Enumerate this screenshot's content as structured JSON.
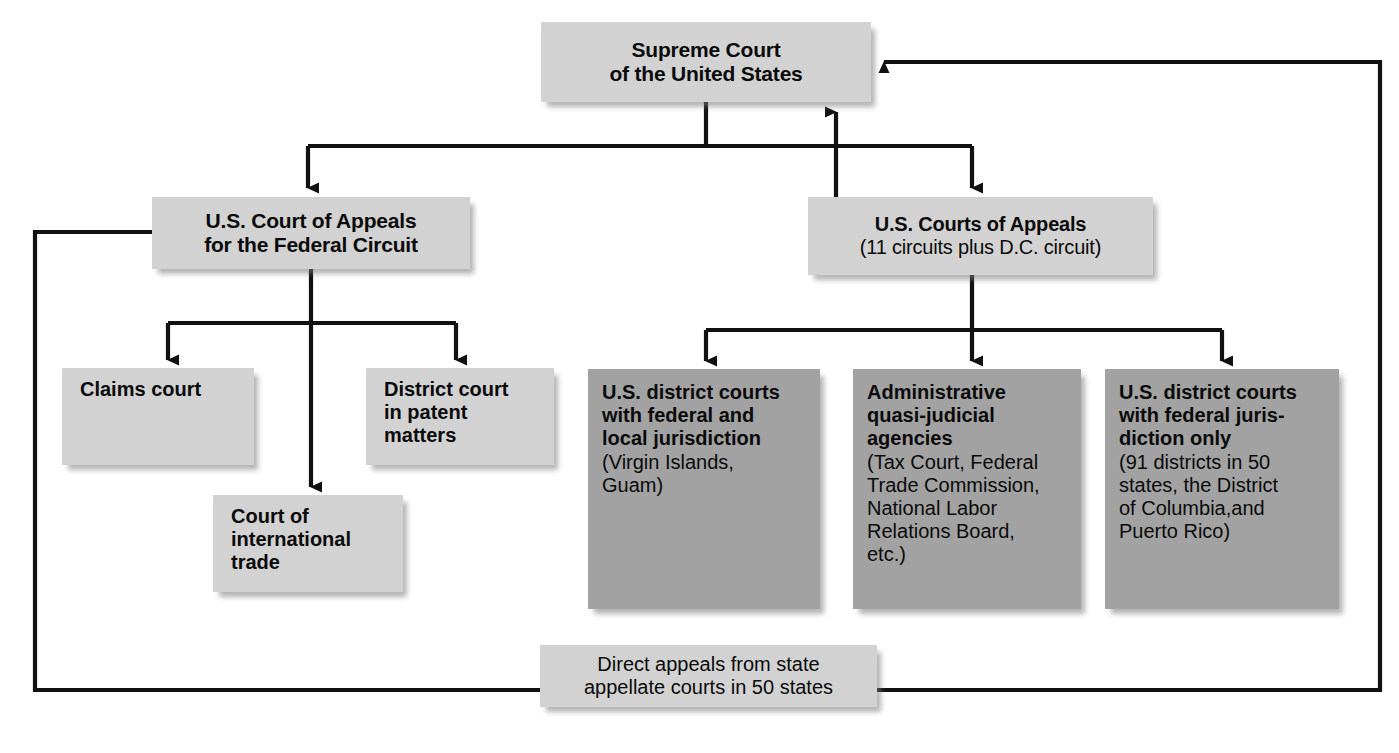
{
  "colors": {
    "box_light": "#d2d2d2",
    "box_dark": "#a2a2a2",
    "line": "#111111",
    "background": "#ffffff"
  },
  "nodes": {
    "supreme": {
      "label": "Supreme Court\nof the United States",
      "level": "top",
      "shade": "light"
    },
    "federal_circuit": {
      "label": "U.S. Court of Appeals\nfor the Federal Circuit",
      "level": "appellate",
      "shade": "light"
    },
    "courts_appeals": {
      "label": "U.S. Courts of Appeals",
      "sublabel": "(11 circuits plus D.C. circuit)",
      "level": "appellate",
      "shade": "light"
    },
    "claims_court": {
      "label": "Claims court",
      "level": "trial",
      "shade": "light"
    },
    "district_patent": {
      "label": "District court\nin patent\nmatters",
      "level": "trial",
      "shade": "light"
    },
    "international_trade": {
      "label": "Court of\ninternational\ntrade",
      "level": "trial",
      "shade": "light"
    },
    "district_local": {
      "label": "U.S. district courts\nwith federal and\nlocal jurisdiction",
      "sublabel": "(Virgin Islands,\nGuam)",
      "level": "trial",
      "shade": "dark"
    },
    "admin_agencies": {
      "label": "Administrative\nquasi-judicial\nagencies",
      "sublabel": "(Tax Court, Federal\nTrade Commission,\nNational Labor\nRelations Board,\netc.)",
      "level": "trial",
      "shade": "dark"
    },
    "district_federal": {
      "label": "U.S. district courts\nwith federal juris-\ndiction only",
      "sublabel": "(91 districts in 50\nstates, the District\nof Columbia,and\nPuerto Rico)",
      "level": "trial",
      "shade": "dark"
    },
    "direct_appeals": {
      "label": "Direct appeals from state\nappellate courts in 50 states",
      "level": "bottom",
      "shade": "light"
    }
  },
  "connections": [
    {
      "from": "supreme",
      "to": "federal_circuit",
      "style": "arrow-down"
    },
    {
      "from": "supreme",
      "to": "courts_appeals",
      "style": "arrow-down"
    },
    {
      "from": "courts_appeals",
      "to": "supreme",
      "style": "arrow-up"
    },
    {
      "from": "federal_circuit",
      "to": "claims_court",
      "style": "arrow-down"
    },
    {
      "from": "federal_circuit",
      "to": "international_trade",
      "style": "arrow-down"
    },
    {
      "from": "federal_circuit",
      "to": "district_patent",
      "style": "arrow-down"
    },
    {
      "from": "courts_appeals",
      "to": "district_local",
      "style": "arrow-down"
    },
    {
      "from": "courts_appeals",
      "to": "admin_agencies",
      "style": "arrow-down"
    },
    {
      "from": "courts_appeals",
      "to": "district_federal",
      "style": "arrow-down"
    },
    {
      "from": "federal_circuit",
      "to": "direct_appeals",
      "style": "elbow-left"
    },
    {
      "from": "direct_appeals",
      "to": "supreme",
      "style": "elbow-right-arrow"
    }
  ]
}
